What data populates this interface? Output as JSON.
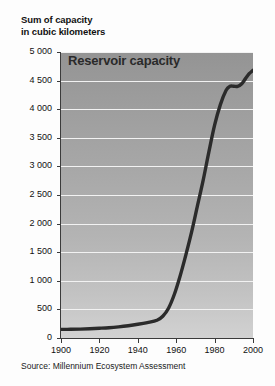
{
  "axis_title": {
    "line1": "Sum of capacity",
    "line2": "in cubic kilometers"
  },
  "source": "Source: Millennium Ecosystem Assessment",
  "chart_data": {
    "type": "line",
    "title": "Reservoir capacity",
    "xlabel": "",
    "ylabel": "Sum of capacity in cubic kilometers",
    "xlim": [
      1900,
      2000
    ],
    "ylim": [
      0,
      5000
    ],
    "grid": true,
    "legend": "none",
    "xticks": [
      1900,
      1920,
      1940,
      1960,
      1980,
      2000
    ],
    "xtick_labels": [
      "1900",
      "1920",
      "1940",
      "1960",
      "1980",
      "2000"
    ],
    "yticks": [
      0,
      500,
      1000,
      1500,
      2000,
      2500,
      3000,
      3500,
      4000,
      4500,
      5000
    ],
    "ytick_labels": [
      "0",
      "500",
      "1 000",
      "1 500",
      "2 000",
      "2 500",
      "3 000",
      "3 500",
      "4 000",
      "4 500",
      "5 000"
    ],
    "series": [
      {
        "name": "Reservoir capacity",
        "color": "#2b2b2b",
        "x": [
          1900,
          1905,
          1910,
          1915,
          1920,
          1925,
          1930,
          1935,
          1940,
          1945,
          1950,
          1953,
          1956,
          1959,
          1962,
          1965,
          1968,
          1971,
          1974,
          1977,
          1980,
          1983,
          1986,
          1988,
          1990,
          1992,
          1994,
          1996,
          1998,
          2000
        ],
        "values": [
          150,
          152,
          156,
          162,
          170,
          180,
          195,
          215,
          240,
          270,
          310,
          380,
          520,
          760,
          1080,
          1450,
          1850,
          2300,
          2750,
          3250,
          3720,
          4080,
          4330,
          4400,
          4400,
          4400,
          4440,
          4530,
          4620,
          4680
        ]
      }
    ]
  }
}
